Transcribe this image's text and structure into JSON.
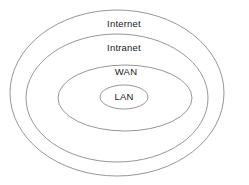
{
  "diagram": {
    "type": "concentric-ellipse-venn",
    "background_color": "#ffffff",
    "stroke_color": "#8a8a8a",
    "text_color": "#1a1a1a",
    "rings": [
      {
        "id": "internet",
        "label": "Internet",
        "level": 1,
        "cx": 117,
        "cy": 93,
        "rx": 107,
        "ry": 83,
        "label_x": 124,
        "label_y": 24
      },
      {
        "id": "intranet",
        "label": "Intranet",
        "level": 2,
        "cx": 117,
        "cy": 98,
        "rx": 91,
        "ry": 64,
        "label_x": 124,
        "label_y": 48
      },
      {
        "id": "wan",
        "label": "WAN",
        "level": 3,
        "cx": 125,
        "cy": 98,
        "rx": 67,
        "ry": 33,
        "label_x": 126,
        "label_y": 72
      },
      {
        "id": "lan",
        "label": "LAN",
        "level": 4,
        "cx": 124,
        "cy": 97,
        "rx": 24,
        "ry": 12,
        "label_x": 124,
        "label_y": 97
      }
    ]
  }
}
